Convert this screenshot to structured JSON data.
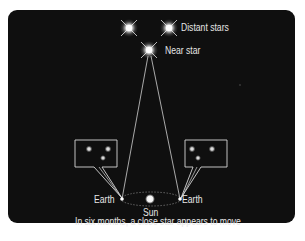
{
  "diagram": {
    "labels": {
      "distant_stars": "Distant stars",
      "near_star": "Near star",
      "earth_left": "Earth",
      "earth_right": "Earth",
      "sun": "Sun",
      "caption": "In six months, a close star appears to move"
    },
    "colors": {
      "background": "#0f0f0f",
      "line": "#d9d9d9",
      "text": "#e6e6e6",
      "star_glow": "#ffffff",
      "page": "#ffffff"
    },
    "icons": {
      "distant_star_1": "star-burst-icon",
      "distant_star_2": "star-burst-icon",
      "near_star": "star-burst-icon",
      "sun": "sun-dot-icon",
      "earth_left": "earth-dot-icon",
      "earth_right": "earth-dot-icon"
    },
    "view_bubbles": [
      {
        "position": "left",
        "stars": [
          "upper-left",
          "upper-right",
          "lower-middle"
        ]
      },
      {
        "position": "right",
        "stars": [
          "upper-left",
          "upper-right",
          "lower-left-middle"
        ]
      }
    ]
  }
}
